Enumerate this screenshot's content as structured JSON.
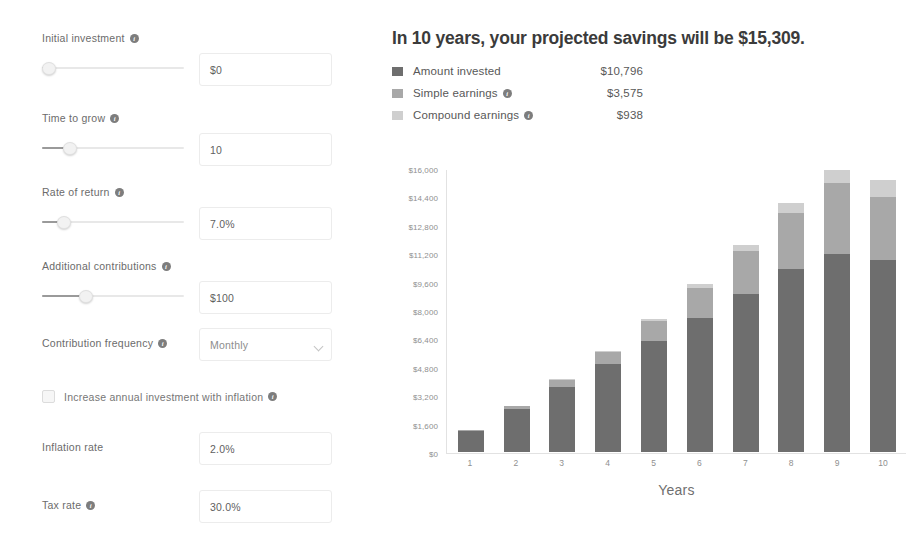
{
  "form": {
    "fields": [
      {
        "label": "Initial investment",
        "has_info": true,
        "value": "$0",
        "slider": 2
      },
      {
        "label": "Time to grow",
        "has_info": true,
        "value": "10",
        "slider": 19
      },
      {
        "label": "Rate of return",
        "has_info": true,
        "value": "7.0%",
        "slider": 14
      },
      {
        "label": "Additional contributions",
        "has_info": true,
        "value": "$100",
        "slider": 30
      }
    ],
    "frequency": {
      "label": "Contribution frequency",
      "has_info": true,
      "value": "Monthly"
    },
    "inflation_checkbox": {
      "label": "Increase annual investment with inflation",
      "has_info": true,
      "checked": false
    },
    "inflation_rate": {
      "label": "Inflation rate",
      "has_info": false,
      "value": "2.0%"
    },
    "tax_rate": {
      "label": "Tax rate",
      "has_info": true,
      "value": "30.0%"
    }
  },
  "result": {
    "headline": "In 10 years, your projected savings will be $15,309.",
    "legend": [
      {
        "label": "Amount invested",
        "value": "$10,796",
        "color": "#6e6e6e",
        "has_info": false
      },
      {
        "label": "Simple earnings",
        "value": "$3,575",
        "color": "#a8a8a8",
        "has_info": true
      },
      {
        "label": "Compound earnings",
        "value": "$938",
        "color": "#cfcfcf",
        "has_info": true
      }
    ]
  },
  "chart_data": {
    "type": "bar",
    "stacked": true,
    "title": "",
    "xlabel": "Years",
    "ylabel": "",
    "categories": [
      "1",
      "2",
      "3",
      "4",
      "5",
      "6",
      "7",
      "8",
      "9",
      "10"
    ],
    "ylim": [
      0,
      16000
    ],
    "yticks": [
      0,
      1600,
      3200,
      4800,
      6400,
      8000,
      9600,
      11200,
      12800,
      14400,
      16000
    ],
    "ytick_labels": [
      "$0",
      "$1,600",
      "$3,200",
      "$4,800",
      "$6,400",
      "$8,000",
      "$9,600",
      "$11,200",
      "$12,800",
      "$14,400",
      "$16,000"
    ],
    "grid": false,
    "legend_position": "above-chart",
    "series": [
      {
        "name": "Amount invested",
        "color": "#6e6e6e",
        "values": [
          1200,
          2424,
          3672,
          4946,
          6245,
          7570,
          8921,
          10300,
          11706,
          10796
        ]
      },
      {
        "name": "Simple earnings",
        "color": "#a8a8a8",
        "values": [
          42,
          170,
          390,
          712,
          1144,
          1696,
          2376,
          3194,
          4158,
          3575
        ]
      },
      {
        "name": "Compound earnings",
        "color": "#cfcfcf",
        "values": [
          0,
          6,
          24,
          62,
          126,
          224,
          362,
          548,
          790,
          938
        ]
      }
    ],
    "totals": [
      1242,
      2600,
      4086,
      5720,
      7515,
      9490,
      11659,
      14042,
      16654,
      15309
    ]
  }
}
